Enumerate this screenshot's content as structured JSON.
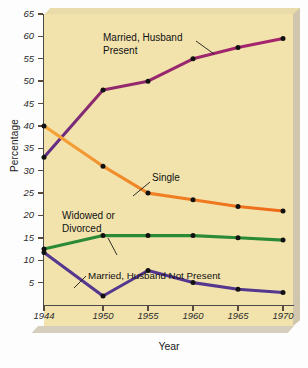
{
  "chart_data": {
    "type": "line",
    "title": "",
    "xlabel": "Year",
    "ylabel": "Percentage",
    "grid": false,
    "legend": "inline-annotations",
    "categories": [
      "1944",
      "1950",
      "1955",
      "1960",
      "1965",
      "1970"
    ],
    "x": [
      1944,
      1950,
      1955,
      1960,
      1965,
      1970
    ],
    "xlim": [
      1944,
      1970
    ],
    "ylim": [
      0,
      65
    ],
    "yticks": [
      5,
      10,
      15,
      20,
      25,
      30,
      35,
      40,
      45,
      50,
      55,
      60,
      65
    ],
    "xticks": [
      "1944",
      "1950",
      "1955",
      "1960",
      "1965",
      "1970"
    ],
    "series": [
      {
        "name": "Married, Husband Present",
        "color": "#8e2a6e",
        "values": [
          33,
          48,
          50,
          55,
          57.5,
          59.5
        ]
      },
      {
        "name": "Single",
        "color": "#f07d20",
        "values": [
          40,
          31,
          25,
          23.5,
          22,
          21
        ]
      },
      {
        "name": "Widowed or Divorced",
        "color": "#2b8a36",
        "values": [
          12.5,
          15.5,
          15.5,
          15.5,
          15,
          14.5
        ]
      },
      {
        "name": "Married, Husband Not Present",
        "color": "#55378f",
        "values": [
          11.7,
          2,
          7.7,
          5,
          3.5,
          2.8
        ]
      }
    ],
    "annotations": [
      {
        "id": "ann-married-present",
        "text": "Married, Husband\nPresent"
      },
      {
        "id": "ann-single",
        "text": "Single"
      },
      {
        "id": "ann-widowed",
        "text": "Widowed or\nDivorced"
      },
      {
        "id": "ann-married-not-present",
        "text": "Married, Husband Not Present"
      }
    ],
    "colors": {
      "plot_background": "#f2e3ad",
      "page_background": "#ffffff",
      "axis": "#4a4a4a",
      "marker": "#111111",
      "bevel": "#cfc6ad"
    }
  }
}
